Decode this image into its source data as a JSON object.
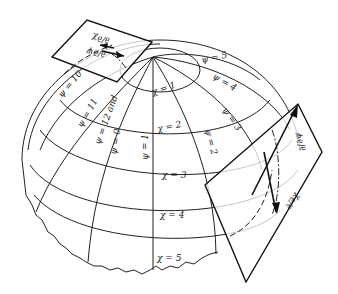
{
  "figure": {
    "chi_labels": [
      "χ = 1",
      "χ = 2",
      "χ = 3",
      "χ = 4",
      "χ = 5"
    ],
    "psi_labels": [
      "ψ = 0",
      "ψ = 1",
      "ψ = 2",
      "ψ = 3",
      "ψ = 4",
      "ψ = 5",
      "ψ = 10",
      "ψ = 11",
      "ψ = 12 and"
    ],
    "tangent_plane_top": {
      "vector_labels": [
        "∂/∂χ",
        "∂/∂ψ"
      ]
    },
    "tangent_plane_right": {
      "vector_labels": [
        "∂/∂ψ",
        "∂/∂χ"
      ]
    }
  }
}
